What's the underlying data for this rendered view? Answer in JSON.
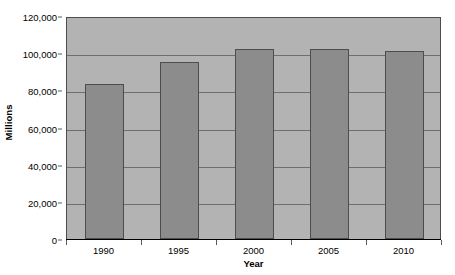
{
  "chart_data": {
    "type": "bar",
    "title": "",
    "xlabel": "Year",
    "ylabel": "Millions",
    "categories": [
      "1990",
      "1995",
      "2000",
      "2005",
      "2010"
    ],
    "values": [
      83500,
      95000,
      102500,
      102000,
      101000
    ],
    "ylim": [
      0,
      120000
    ],
    "yticks": [
      0,
      20000,
      40000,
      60000,
      80000,
      100000,
      120000
    ],
    "ytick_labels": [
      "0",
      "20,000",
      "40,000",
      "60,000",
      "80,000",
      "100,000",
      "120,000"
    ],
    "grid": true,
    "legend": false,
    "series": [
      {
        "name": "Millions",
        "values": [
          83500,
          95000,
          102500,
          102000,
          101000
        ]
      }
    ],
    "colors": {
      "bar_fill": "#8c8c8c",
      "bar_border": "#4d4d4d",
      "plot_background": "#b3b3b3",
      "gridline": "#6e6e6e",
      "axis": "#000000",
      "text": "#000000",
      "page_background": "#ffffff"
    }
  }
}
